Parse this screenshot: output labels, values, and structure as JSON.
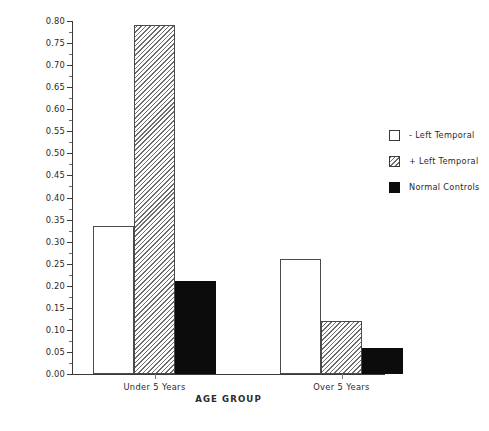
{
  "chart_data": {
    "type": "bar",
    "title": "",
    "subtitle": "",
    "xlabel": "AGE GROUP",
    "ylabel": "Mean Morphological Errors per Proposition",
    "categories": [
      "Under 5 Years",
      "Over 5 Years"
    ],
    "series": [
      {
        "name": "- Left Temporal",
        "style": "open",
        "values": [
          0.335,
          0.26
        ]
      },
      {
        "name": "+ Left Temporal",
        "style": "hatch",
        "values": [
          0.79,
          0.12
        ]
      },
      {
        "name": "Normal Controls",
        "style": "solid",
        "values": [
          0.21,
          0.06
        ]
      }
    ],
    "ylim": [
      0.0,
      0.8
    ],
    "ytick_step": 0.05,
    "ytick_labels": [
      "0.00",
      "0.05",
      "0.10",
      "0.15",
      "0.20",
      "0.25",
      "0.30",
      "0.35",
      "0.40",
      "0.45",
      "0.50",
      "0.55",
      "0.60",
      "0.65",
      "0.70",
      "0.75",
      "0.80"
    ],
    "grid": false,
    "legend_position": "right",
    "colors": {
      "axis": "#3a3a3a",
      "text": "#2a2a2a",
      "open_fill": "#ffffff",
      "hatch_line": "#6d6d6d",
      "solid_fill": "#0c0c0c"
    }
  }
}
